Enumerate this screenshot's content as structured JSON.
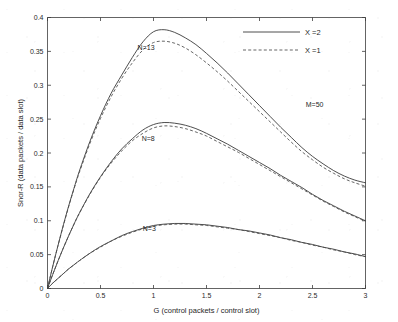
{
  "chart_data": {
    "type": "line",
    "title": "",
    "xlabel": "G (control packets / control slot)",
    "ylabel": "Snor-R (data packets / data slot)",
    "xlim": [
      0,
      3
    ],
    "ylim": [
      0,
      0.4
    ],
    "xticks": [
      "0",
      "0.5",
      "1",
      "1.5",
      "2",
      "2.5",
      "3"
    ],
    "xtick_values": [
      0,
      0.5,
      1,
      1.5,
      2,
      2.5,
      3
    ],
    "yticks": [
      "0",
      "0.05",
      "0.1",
      "0.15",
      "0.2",
      "0.25",
      "0.3",
      "0.35",
      "0.4"
    ],
    "ytick_values": [
      0,
      0.05,
      0.1,
      0.15,
      0.2,
      0.25,
      0.3,
      0.35,
      0.4
    ],
    "grid": false,
    "legend_position": "top-right",
    "legend": [
      {
        "label": "X =2",
        "style": "solid"
      },
      {
        "label": "X =1",
        "style": "dashed"
      }
    ],
    "annotations": [
      {
        "text": "N=13",
        "x": 0.93,
        "y": 0.352
      },
      {
        "text": "N=8",
        "x": 0.95,
        "y": 0.218
      },
      {
        "text": "N=3",
        "x": 0.96,
        "y": 0.085
      },
      {
        "text": "M=50",
        "x": 2.52,
        "y": 0.268
      }
    ],
    "x": [
      0,
      0.05,
      0.1,
      0.15,
      0.2,
      0.25,
      0.3,
      0.4,
      0.5,
      0.6,
      0.7,
      0.8,
      0.9,
      1.0,
      1.1,
      1.2,
      1.3,
      1.4,
      1.5,
      1.6,
      1.7,
      1.8,
      1.9,
      2.0,
      2.1,
      2.2,
      2.3,
      2.4,
      2.5,
      2.6,
      2.7,
      2.8,
      2.9,
      3.0
    ],
    "series": [
      {
        "name": "N=13, X=2",
        "group": "N=13",
        "style": "solid",
        "values": [
          0,
          0.033,
          0.064,
          0.094,
          0.122,
          0.148,
          0.173,
          0.217,
          0.255,
          0.288,
          0.315,
          0.341,
          0.364,
          0.379,
          0.382,
          0.378,
          0.37,
          0.36,
          0.347,
          0.333,
          0.318,
          0.302,
          0.286,
          0.27,
          0.254,
          0.238,
          0.223,
          0.208,
          0.195,
          0.184,
          0.174,
          0.166,
          0.16,
          0.156
        ]
      },
      {
        "name": "N=13, X=1",
        "group": "N=13",
        "style": "dashed",
        "values": [
          0,
          0.033,
          0.064,
          0.093,
          0.121,
          0.147,
          0.171,
          0.214,
          0.251,
          0.283,
          0.31,
          0.333,
          0.352,
          0.363,
          0.365,
          0.362,
          0.355,
          0.345,
          0.333,
          0.32,
          0.306,
          0.291,
          0.276,
          0.261,
          0.246,
          0.231,
          0.216,
          0.202,
          0.19,
          0.179,
          0.17,
          0.162,
          0.156,
          0.151
        ]
      },
      {
        "name": "N=8, X=2",
        "group": "N=8",
        "style": "solid",
        "values": [
          0,
          0.021,
          0.041,
          0.06,
          0.078,
          0.095,
          0.111,
          0.14,
          0.165,
          0.187,
          0.206,
          0.221,
          0.234,
          0.242,
          0.245,
          0.244,
          0.241,
          0.236,
          0.229,
          0.221,
          0.213,
          0.204,
          0.195,
          0.186,
          0.177,
          0.167,
          0.158,
          0.149,
          0.139,
          0.13,
          0.122,
          0.114,
          0.107,
          0.1
        ]
      },
      {
        "name": "N=8, X=1",
        "group": "N=8",
        "style": "dashed",
        "values": [
          0,
          0.021,
          0.041,
          0.06,
          0.078,
          0.095,
          0.111,
          0.139,
          0.164,
          0.185,
          0.203,
          0.218,
          0.229,
          0.237,
          0.24,
          0.239,
          0.236,
          0.231,
          0.225,
          0.217,
          0.209,
          0.201,
          0.192,
          0.183,
          0.174,
          0.165,
          0.156,
          0.147,
          0.138,
          0.129,
          0.121,
          0.113,
          0.106,
          0.099
        ]
      },
      {
        "name": "N=3, X=2",
        "group": "N=3",
        "style": "solid",
        "values": [
          0,
          0.008,
          0.015,
          0.022,
          0.029,
          0.035,
          0.041,
          0.052,
          0.062,
          0.07,
          0.078,
          0.084,
          0.089,
          0.093,
          0.095,
          0.096,
          0.096,
          0.095,
          0.094,
          0.092,
          0.09,
          0.087,
          0.085,
          0.082,
          0.079,
          0.075,
          0.072,
          0.068,
          0.065,
          0.061,
          0.058,
          0.054,
          0.051,
          0.047
        ]
      },
      {
        "name": "N=3, X=1",
        "group": "N=3",
        "style": "dashed",
        "values": [
          0,
          0.008,
          0.015,
          0.022,
          0.029,
          0.035,
          0.041,
          0.052,
          0.061,
          0.07,
          0.077,
          0.083,
          0.088,
          0.092,
          0.094,
          0.095,
          0.095,
          0.094,
          0.093,
          0.091,
          0.089,
          0.087,
          0.084,
          0.081,
          0.078,
          0.075,
          0.071,
          0.068,
          0.064,
          0.061,
          0.057,
          0.054,
          0.05,
          0.047
        ]
      }
    ]
  }
}
